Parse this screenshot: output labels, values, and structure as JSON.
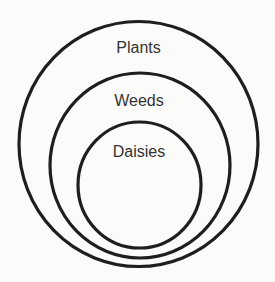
{
  "diagram": {
    "type": "nested-set-diagram",
    "sets": [
      {
        "id": "plants",
        "label": "Plants",
        "cx": 138.5,
        "cy": 144,
        "rx": 119.5,
        "ry": 122.5,
        "label_x": 138.5,
        "label_y": 53
      },
      {
        "id": "weeds",
        "label": "Weeds",
        "cx": 140,
        "cy": 165.5,
        "rx": 90,
        "ry": 92.5,
        "label_x": 139,
        "label_y": 106
      },
      {
        "id": "daisies",
        "label": "Daisies",
        "cx": 139.5,
        "cy": 185,
        "rx": 61.5,
        "ry": 63,
        "label_x": 139,
        "label_y": 157
      }
    ],
    "relationship": "Daisies ⊂ Weeds ⊂ Plants",
    "colors": {
      "stroke": "#1e1e1e",
      "text": "#333333",
      "background": "#fbfbfa"
    }
  }
}
